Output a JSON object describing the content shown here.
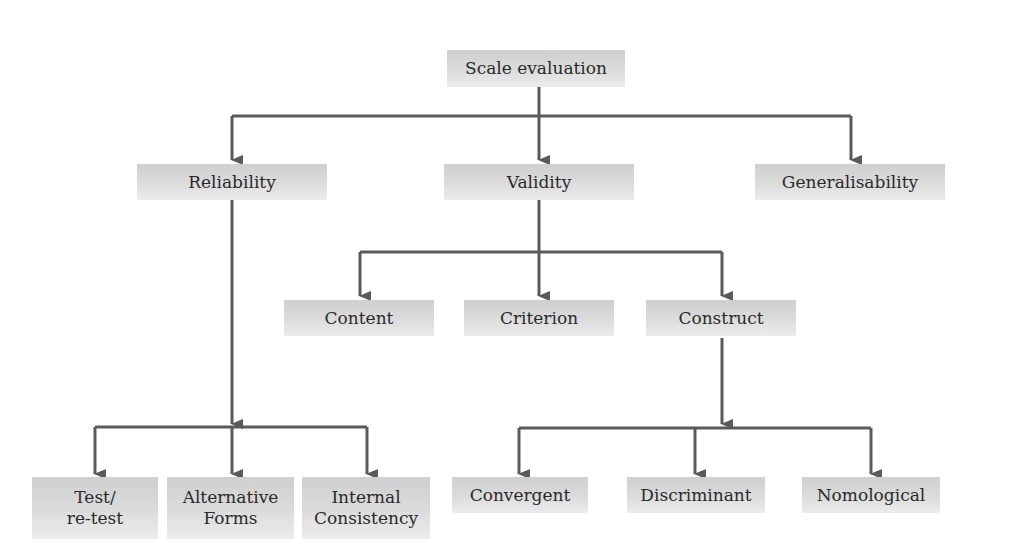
{
  "diagram": {
    "type": "tree",
    "line_color": "#5a5a5a",
    "node_fill": "#d8d8d8",
    "root": {
      "label": "Scale evaluation"
    },
    "level1": [
      {
        "label": "Reliability"
      },
      {
        "label": "Validity"
      },
      {
        "label": "Generalisability"
      }
    ],
    "validity_children": [
      {
        "label": "Content"
      },
      {
        "label": "Criterion"
      },
      {
        "label": "Construct"
      }
    ],
    "reliability_children": [
      {
        "line1": "Test/",
        "line2": "re-test"
      },
      {
        "line1": "Alternative",
        "line2": "Forms"
      },
      {
        "line1": "Internal",
        "line2": "Consistency"
      }
    ],
    "construct_children": [
      {
        "label": "Convergent"
      },
      {
        "label": "Discriminant"
      },
      {
        "label": "Nomological"
      }
    ]
  }
}
